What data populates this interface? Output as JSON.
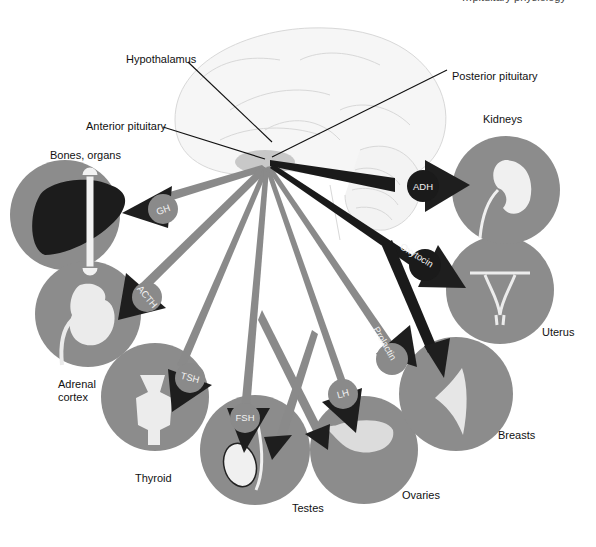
{
  "header": {
    "cut_off_text": "…pituitary physiology"
  },
  "structures": {
    "hypothalamus": "Hypothalamus",
    "anterior_pituitary": "Anterior pituitary",
    "posterior_pituitary": "Posterior pituitary"
  },
  "targets": {
    "bones_organs": "Bones, organs",
    "adrenal_line1": "Adrenal",
    "adrenal_line2": "cortex",
    "thyroid": "Thyroid",
    "testes": "Testes",
    "ovaries": "Ovaries",
    "breasts": "Breasts",
    "uterus": "Uterus",
    "kidneys": "Kidneys"
  },
  "hormones": {
    "gh": "GH",
    "acth": "ACTH",
    "tsh": "TSH",
    "fsh": "FSH",
    "lh": "LH",
    "prolactin": "Prolactin",
    "oxytocin": "Oxytocin",
    "adh": "ADH"
  },
  "legend_colors": {
    "anterior_arrow": "#8a8a8a",
    "posterior_arrow": "#1a1a1a",
    "target_circle": "#8c8c8c",
    "arrowhead": "#1e1e1e"
  }
}
